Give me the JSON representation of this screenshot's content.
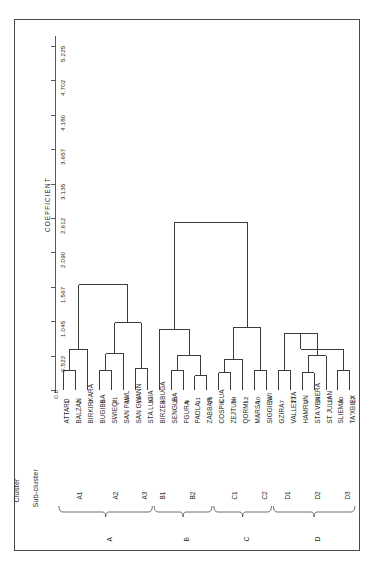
{
  "chart_data": {
    "type": "dendrogram",
    "title": "",
    "ylabel": "COEFFICIENT",
    "xlabel": "",
    "ylim": [
      0.0,
      5.225
    ],
    "y_ticks": [
      "0.0",
      "0.522",
      "1.045",
      "1.567",
      "2.090",
      "2.612",
      "3.135",
      "3.657",
      "4.180",
      "4.702",
      "5.225"
    ],
    "y_tick_values": [
      0.0,
      0.522,
      1.045,
      1.567,
      2.09,
      2.612,
      3.135,
      3.657,
      4.18,
      4.702,
      5.225
    ],
    "grid": false,
    "legend": "none",
    "orientation": "vertical-leaves-bottom",
    "row_labels": {
      "cluster": "Cluster",
      "subcluster": "Sub-cluster"
    },
    "leaves": [
      {
        "id": 1,
        "name": "ATTARD",
        "subcluster": "A1",
        "cluster": "A"
      },
      {
        "id": 2,
        "name": "BALZAN",
        "subcluster": "A1",
        "cluster": "A"
      },
      {
        "id": 3,
        "name": "BIRKIRKARA",
        "subcluster": "A1",
        "cluster": "A"
      },
      {
        "id": 5,
        "name": "BUGIBBA",
        "subcluster": "A2",
        "cluster": "A"
      },
      {
        "id": 21,
        "name": "SWIEQI",
        "subcluster": "A2",
        "cluster": "A"
      },
      {
        "id": 15,
        "name": "SAN PAWL",
        "subcluster": "A2",
        "cluster": "A"
      },
      {
        "id": 13,
        "name": "SAN GWANN",
        "subcluster": "A3",
        "cluster": "A"
      },
      {
        "id": 14,
        "name": "STA LUCIA",
        "subcluster": "A3",
        "cluster": "A"
      },
      {
        "id": 4,
        "name": "BIRZEBBUGA",
        "subcluster": "B1",
        "cluster": "B"
      },
      {
        "id": 18,
        "name": "SENGLEA",
        "subcluster": "B2",
        "cluster": "B"
      },
      {
        "id": 8,
        "name": "FGURA",
        "subcluster": "B2",
        "cluster": "B"
      },
      {
        "id": 11,
        "name": "PAOLA",
        "subcluster": "B2",
        "cluster": "B"
      },
      {
        "id": 25,
        "name": "ZABBAR",
        "subcluster": "B2",
        "cluster": "B"
      },
      {
        "id": 6,
        "name": "COSPICUA",
        "subcluster": "C1",
        "cluster": "C"
      },
      {
        "id": 24,
        "name": "ZEJTUN",
        "subcluster": "C1",
        "cluster": "C"
      },
      {
        "id": 12,
        "name": "QORMI",
        "subcluster": "C1",
        "cluster": "C"
      },
      {
        "id": 10,
        "name": "MARSA",
        "subcluster": "C2",
        "cluster": "C"
      },
      {
        "id": 19,
        "name": "SIGGIEWI",
        "subcluster": "C2",
        "cluster": "C"
      },
      {
        "id": 7,
        "name": "GZIRA",
        "subcluster": "D1",
        "cluster": "D"
      },
      {
        "id": 23,
        "name": "VALLETTA",
        "subcluster": "D1",
        "cluster": "D"
      },
      {
        "id": 9,
        "name": "HAMRUN",
        "subcluster": "D2",
        "cluster": "D"
      },
      {
        "id": 16,
        "name": "STA VENERA",
        "subcluster": "D2",
        "cluster": "D"
      },
      {
        "id": 17,
        "name": "ST JULIAN",
        "subcluster": "D2",
        "cluster": "D"
      },
      {
        "id": 20,
        "name": "SLIEMA",
        "subcluster": "D3",
        "cluster": "D"
      },
      {
        "id": 22,
        "name": "TA'XBIEX",
        "subcluster": "D3",
        "cluster": "D"
      }
    ],
    "subclusters": [
      {
        "label": "A1",
        "cluster": "A",
        "leaf_from": 0,
        "leaf_to": 2
      },
      {
        "label": "A2",
        "cluster": "A",
        "leaf_from": 3,
        "leaf_to": 5
      },
      {
        "label": "A3",
        "cluster": "A",
        "leaf_from": 6,
        "leaf_to": 7
      },
      {
        "label": "B1",
        "cluster": "B",
        "leaf_from": 8,
        "leaf_to": 8
      },
      {
        "label": "B2",
        "cluster": "B",
        "leaf_from": 9,
        "leaf_to": 12
      },
      {
        "label": "C1",
        "cluster": "C",
        "leaf_from": 13,
        "leaf_to": 15
      },
      {
        "label": "C2",
        "cluster": "C",
        "leaf_from": 16,
        "leaf_to": 17
      },
      {
        "label": "D1",
        "cluster": "D",
        "leaf_from": 18,
        "leaf_to": 19
      },
      {
        "label": "D2",
        "cluster": "D",
        "leaf_from": 20,
        "leaf_to": 22
      },
      {
        "label": "D3",
        "cluster": "D",
        "leaf_from": 23,
        "leaf_to": 24
      }
    ],
    "clusters": [
      {
        "label": "A",
        "leaf_from": 0,
        "leaf_to": 7
      },
      {
        "label": "B",
        "leaf_from": 8,
        "leaf_to": 12
      },
      {
        "label": "C",
        "leaf_from": 13,
        "leaf_to": 17
      },
      {
        "label": "D",
        "leaf_from": 18,
        "leaf_to": 24
      }
    ],
    "merges": [
      {
        "left": {
          "leaf": 0
        },
        "right": {
          "leaf": 1
        },
        "height": 0.3,
        "id": "m1"
      },
      {
        "left": {
          "node": "m1"
        },
        "right": {
          "leaf": 2
        },
        "height": 0.62,
        "id": "m2"
      },
      {
        "left": {
          "leaf": 3
        },
        "right": {
          "leaf": 4
        },
        "height": 0.3,
        "id": "m3"
      },
      {
        "left": {
          "node": "m3"
        },
        "right": {
          "leaf": 5
        },
        "height": 0.55,
        "id": "m4"
      },
      {
        "left": {
          "leaf": 6
        },
        "right": {
          "leaf": 7
        },
        "height": 0.33,
        "id": "m5"
      },
      {
        "left": {
          "node": "m4"
        },
        "right": {
          "node": "m5"
        },
        "height": 1.02,
        "id": "m6"
      },
      {
        "left": {
          "node": "m2"
        },
        "right": {
          "node": "m6"
        },
        "height": 1.6,
        "id": "m7"
      },
      {
        "left": {
          "leaf": 9
        },
        "right": {
          "leaf": 10
        },
        "height": 0.3,
        "id": "m8"
      },
      {
        "left": {
          "leaf": 11
        },
        "right": {
          "leaf": 12
        },
        "height": 0.22,
        "id": "m9"
      },
      {
        "left": {
          "node": "m8"
        },
        "right": {
          "node": "m9"
        },
        "height": 0.52,
        "id": "m10"
      },
      {
        "left": {
          "leaf": 8
        },
        "right": {
          "node": "m10"
        },
        "height": 0.92,
        "id": "m11"
      },
      {
        "left": {
          "leaf": 13
        },
        "right": {
          "leaf": 14
        },
        "height": 0.26,
        "id": "m12"
      },
      {
        "left": {
          "node": "m12"
        },
        "right": {
          "leaf": 15
        },
        "height": 0.47,
        "id": "m13"
      },
      {
        "left": {
          "leaf": 16
        },
        "right": {
          "leaf": 17
        },
        "height": 0.3,
        "id": "m14"
      },
      {
        "left": {
          "node": "m13"
        },
        "right": {
          "node": "m14"
        },
        "height": 0.95,
        "id": "m15"
      },
      {
        "left": {
          "node": "m11"
        },
        "right": {
          "node": "m15"
        },
        "height": 2.55,
        "id": "m16"
      },
      {
        "left": {
          "leaf": 18
        },
        "right": {
          "leaf": 19
        },
        "height": 0.3,
        "id": "m17"
      },
      {
        "left": {
          "leaf": 20
        },
        "right": {
          "leaf": 21
        },
        "height": 0.26,
        "id": "m18"
      },
      {
        "left": {
          "node": "m18"
        },
        "right": {
          "leaf": 22
        },
        "height": 0.52,
        "id": "m19"
      },
      {
        "left": {
          "node": "m17"
        },
        "right": {
          "node": "m19"
        },
        "height": 0.86,
        "id": "m20"
      },
      {
        "left": {
          "leaf": 23
        },
        "right": {
          "leaf": 24
        },
        "height": 0.3,
        "id": "m21"
      },
      {
        "left": {
          "node": "m20"
        },
        "right": {
          "node": "m21"
        },
        "height": 0.62,
        "id": "m22"
      },
      {
        "left": {
          "node": "m22"
        },
        "right": {
          "node": "m22b"
        },
        "height": 1.12,
        "id": "m23"
      },
      {
        "left": {
          "node": "m16"
        },
        "right": {
          "node": "m23"
        },
        "height": 3.0,
        "id": "m24"
      },
      {
        "left": {
          "node": "m7"
        },
        "right": {
          "node": "m24"
        },
        "height": 5.1,
        "id": "m25"
      }
    ]
  }
}
